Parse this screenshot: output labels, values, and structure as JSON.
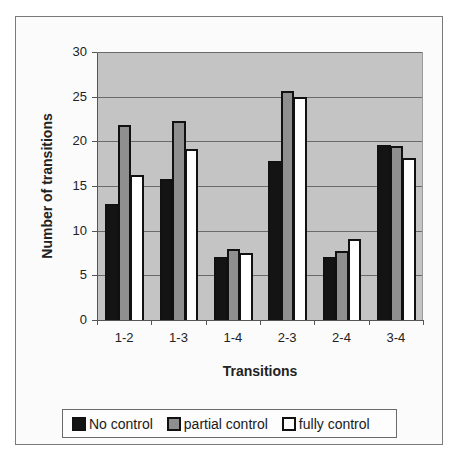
{
  "chart_data": {
    "type": "bar",
    "title": "",
    "xlabel": "Transitions",
    "ylabel": "Number of transitions",
    "categories": [
      "1-2",
      "1-3",
      "1-4",
      "2-3",
      "2-4",
      "3-4"
    ],
    "series": [
      {
        "name": "No control",
        "color": "#141414",
        "values": [
          13.0,
          15.8,
          7.0,
          17.8,
          7.1,
          19.6
        ]
      },
      {
        "name": "partial control",
        "color": "#8f8f8f",
        "values": [
          21.8,
          22.3,
          7.9,
          25.6,
          7.7,
          19.5
        ]
      },
      {
        "name": "fully control",
        "color": "#ffffff",
        "values": [
          16.2,
          19.1,
          7.5,
          25.0,
          9.1,
          18.1
        ]
      }
    ],
    "ylim": [
      0,
      30
    ],
    "yticks": [
      0,
      5,
      10,
      15,
      20,
      25,
      30
    ],
    "grid": true,
    "legend_position": "bottom",
    "plot_background": "#c4c4c4"
  },
  "axes": {
    "y_title": "Number of transitions",
    "x_title": "Transitions",
    "y_tick_labels": [
      "0",
      "5",
      "10",
      "15",
      "20",
      "25",
      "30"
    ],
    "x_tick_labels": [
      "1-2",
      "1-3",
      "1-4",
      "2-3",
      "2-4",
      "3-4"
    ]
  },
  "legend": {
    "items": [
      {
        "label": "No control"
      },
      {
        "label": "partial control"
      },
      {
        "label": "fully control"
      }
    ]
  }
}
